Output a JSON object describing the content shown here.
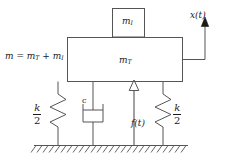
{
  "diagram": {
    "type": "mechanical-vibration-schematic",
    "line_color": "#4d4d4d",
    "text_color": "#1a1a1a",
    "background": "#ffffff",
    "labels": {
      "mass_total_equation": "m = m",
      "mass_total_sub1": "T",
      "mass_total_plus": " + m",
      "mass_total_sub2": "I",
      "top_block": "m",
      "top_block_sub": "I",
      "main_block": "m",
      "main_block_sub": "T",
      "displacement": "x(t)",
      "damper": "c",
      "force": "f(t)",
      "spring_numerator": "k",
      "spring_denominator": "2"
    },
    "elements": {
      "top_block_name": "mass-mI-block",
      "main_block_name": "mass-mT-block",
      "left_spring_name": "left-spring",
      "right_spring_name": "right-spring",
      "damper_name": "dashpot-damper",
      "force_arrow_name": "force-arrow",
      "displacement_arrow_name": "displacement-arrow",
      "ground_name": "ground-hatching"
    }
  }
}
